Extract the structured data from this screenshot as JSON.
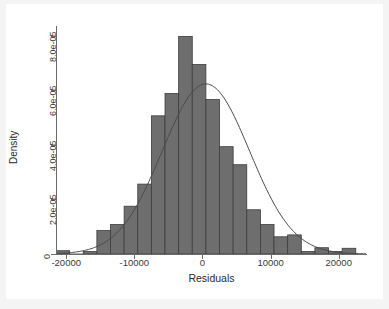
{
  "chart_data": {
    "type": "bar",
    "title": "",
    "subtitle": "",
    "xlabel": "Residuals",
    "ylabel": "Density",
    "xlim": [
      -21500,
      24000
    ],
    "ylim": [
      0,
      8.35e-05
    ],
    "grid": false,
    "legend": null,
    "bin_width": 2000,
    "x_ticks": [
      -20000,
      -10000,
      0,
      10000,
      20000
    ],
    "x_tick_labels": [
      "-20000",
      "-10000",
      "0",
      "10000",
      "20000"
    ],
    "y_ticks": [
      0,
      2e-05,
      4e-05,
      6e-05,
      8e-05
    ],
    "y_tick_labels": [
      "0",
      "2.0e-05",
      "4.0e-05",
      "6.0e-05",
      "8.0e-05"
    ],
    "bar_color": "#6e6e6e",
    "bar_edge_color": "#3d3d3d",
    "overlay_line_color": "#4a4a4a",
    "bins": [
      {
        "left": -21500,
        "right": -19500,
        "density": 1.2e-06
      },
      {
        "left": -19500,
        "right": -17500,
        "density": 0.0
      },
      {
        "left": -17500,
        "right": -15500,
        "density": 9e-07
      },
      {
        "left": -15500,
        "right": -13500,
        "density": 8.6e-06
      },
      {
        "left": -13500,
        "right": -11500,
        "density": 1.08e-05
      },
      {
        "left": -11500,
        "right": -9500,
        "density": 1.75e-05
      },
      {
        "left": -9500,
        "right": -7500,
        "density": 2.56e-05
      },
      {
        "left": -7500,
        "right": -5500,
        "density": 5.06e-05
      },
      {
        "left": -5500,
        "right": -3500,
        "density": 5.88e-05
      },
      {
        "left": -3500,
        "right": -1500,
        "density": 7.97e-05
      },
      {
        "left": -1500,
        "right": 500,
        "density": 6.94e-05
      },
      {
        "left": 500,
        "right": 2500,
        "density": 5.66e-05
      },
      {
        "left": 2500,
        "right": 4500,
        "density": 3.93e-05
      },
      {
        "left": 4500,
        "right": 6500,
        "density": 3.27e-05
      },
      {
        "left": 6500,
        "right": 8500,
        "density": 1.62e-05
      },
      {
        "left": 8500,
        "right": 10500,
        "density": 1.08e-05
      },
      {
        "left": 10500,
        "right": 12500,
        "density": 6.3e-06
      },
      {
        "left": 12500,
        "right": 14500,
        "density": 7e-06
      },
      {
        "left": 14500,
        "right": 16500,
        "density": 9e-07
      },
      {
        "left": 16500,
        "right": 18500,
        "density": 2.3e-06
      },
      {
        "left": 18500,
        "right": 20500,
        "density": 9e-07
      },
      {
        "left": 20500,
        "right": 22500,
        "density": 2.1e-06
      }
    ],
    "normal_overlay": {
      "label": "normal density",
      "mean": 500,
      "sd": 6400,
      "peak_density": 6.23e-05
    }
  }
}
